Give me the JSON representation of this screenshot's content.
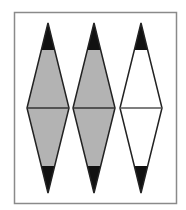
{
  "figure": {
    "colors": {
      "border": "#8a8a8a",
      "shaded_fill": "#b3b3b3",
      "unshaded_fill": "#ffffff",
      "tip_fill": "#111111",
      "outline": "#222222"
    },
    "diamonds": [
      {
        "label": "diamond-1",
        "cx": 48,
        "fill": "shaded"
      },
      {
        "label": "diamond-2",
        "cx": 94,
        "fill": "shaded"
      },
      {
        "label": "diamond-3",
        "cx": 141,
        "fill": "unshaded"
      }
    ]
  }
}
